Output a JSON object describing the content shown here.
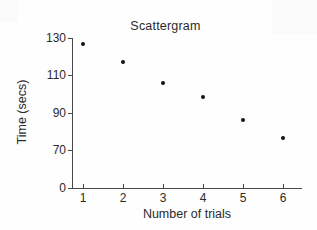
{
  "chart_data": {
    "type": "scatter",
    "title": "Scattergram",
    "xlabel": "Number of trials",
    "ylabel": "Time (secs)",
    "x": [
      1,
      2,
      3,
      4,
      5,
      6
    ],
    "values": [
      127,
      117,
      106,
      98,
      86,
      76
    ],
    "points": [
      {
        "x": 1,
        "y": 127
      },
      {
        "x": 2,
        "y": 117
      },
      {
        "x": 3,
        "y": 106
      },
      {
        "x": 4,
        "y": 98
      },
      {
        "x": 5,
        "y": 86
      },
      {
        "x": 6,
        "y": 76
      }
    ],
    "xtick_labels": [
      "1",
      "2",
      "3",
      "4",
      "5",
      "6"
    ],
    "ytick_labels": [
      "130",
      "110",
      "90",
      "70",
      "0"
    ],
    "ytick_values": [
      130,
      110,
      90,
      70,
      0
    ],
    "xlim": [
      0.55,
      6.6
    ],
    "ylim": [
      0,
      136
    ],
    "y_axis_has_break": true,
    "grid": false,
    "legend": null,
    "marker": "filled-circle",
    "marker_color": "#111111",
    "axis_color": "#4a4a4a",
    "background_color": "#ffffff"
  },
  "axis_geometry": {
    "ytick_pixel_y": [
      38,
      75,
      113,
      150,
      188
    ],
    "xtick_pixel_x": [
      83,
      123,
      163,
      203,
      243,
      283
    ],
    "point_pixel": [
      {
        "left": 83,
        "top": 44
      },
      {
        "left": 123,
        "top": 62
      },
      {
        "left": 163,
        "top": 83
      },
      {
        "left": 203,
        "top": 97
      },
      {
        "left": 243,
        "top": 120
      },
      {
        "left": 283,
        "top": 138
      }
    ]
  }
}
